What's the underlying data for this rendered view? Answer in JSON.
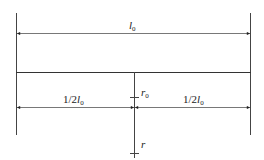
{
  "diagram": {
    "type": "dimension-drawing",
    "labels": {
      "total_length": {
        "var": "l",
        "sub": "0"
      },
      "half_left": {
        "prefix": "1/2",
        "var": "l",
        "sub": "0"
      },
      "half_right": {
        "prefix": "1/2",
        "var": "l",
        "sub": "0"
      },
      "inner_radius": {
        "var": "r",
        "sub": "0"
      },
      "radius": {
        "var": "r",
        "sub": ""
      }
    },
    "colors": {
      "line": "#333333",
      "dim_line": "#555555",
      "background": "#ffffff"
    }
  }
}
